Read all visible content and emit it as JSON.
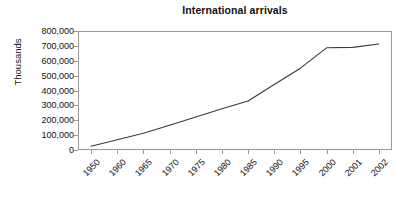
{
  "chart_data": {
    "type": "line",
    "title": "International arrivals",
    "xlabel": "",
    "ylabel": "Thousands",
    "categories": [
      "1950",
      "1960",
      "1965",
      "1970",
      "1975",
      "1980",
      "1985",
      "1990",
      "1995",
      "2000",
      "2001",
      "2002"
    ],
    "values": [
      25000,
      69000,
      113000,
      166000,
      222000,
      278000,
      330000,
      440000,
      550000,
      687000,
      690000,
      713000
    ],
    "series": [
      {
        "name": "International arrivals",
        "values": [
          25000,
          69000,
          113000,
          166000,
          222000,
          278000,
          330000,
          440000,
          550000,
          687000,
          690000,
          713000
        ]
      }
    ],
    "ylim": [
      0,
      800000
    ],
    "ytick_labels": [
      "800,000",
      "700,000",
      "600,000",
      "500,000",
      "400,000",
      "300,000",
      "200,000",
      "100,000",
      "0"
    ],
    "ytick_values": [
      800000,
      700000,
      600000,
      500000,
      400000,
      300000,
      200000,
      100000,
      0
    ],
    "grid": false,
    "legend": false,
    "legend_position": "none",
    "line_color": "#3a3a3a",
    "axis_color": "#9a9a9a",
    "background_color": "#ffffff",
    "text_color": "#111111"
  }
}
